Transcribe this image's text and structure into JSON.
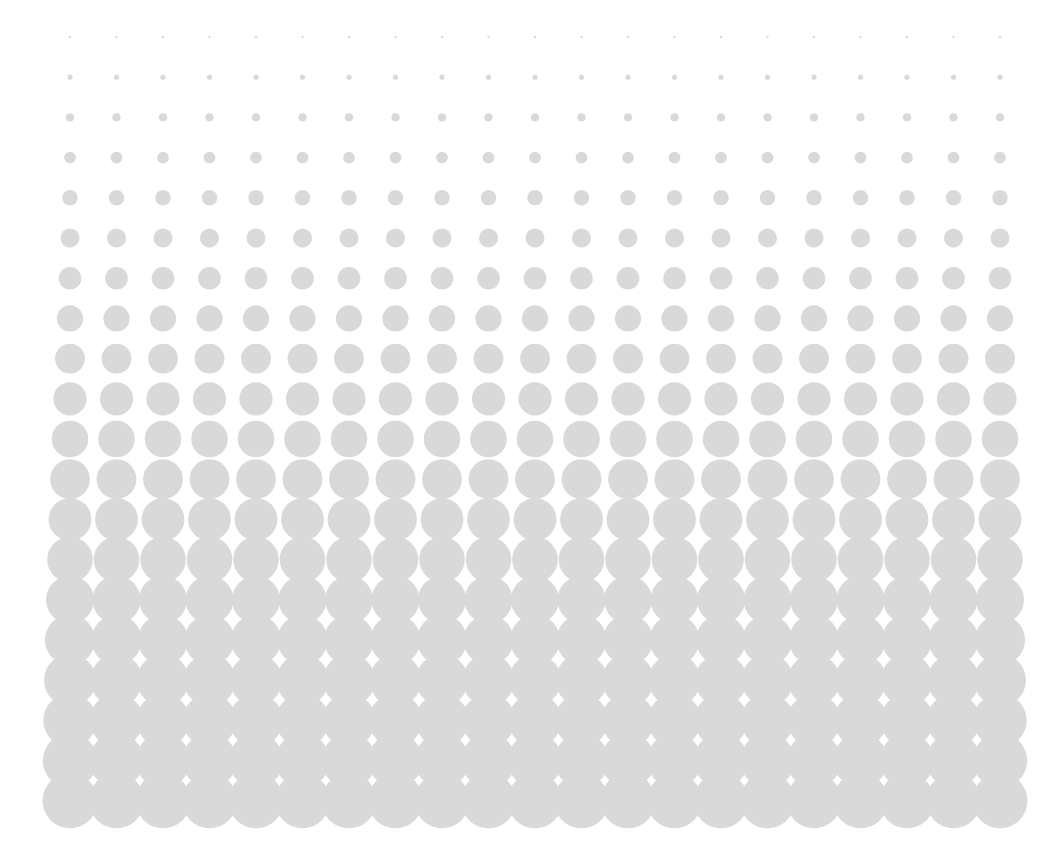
{
  "canvas": {
    "name": "halftone-gradient-pattern",
    "width": 1063,
    "height": 864,
    "background_color": "#ffffff",
    "title": "Halftone Dot Gradient"
  },
  "chart_data": {
    "type": "scatter",
    "subtitle": "",
    "xlabel": "",
    "ylabel": "",
    "grid": false,
    "legend_position": "none",
    "xlim": [
      0,
      1063
    ],
    "ylim": [
      0,
      864
    ],
    "marker_color": "#d9d9d9",
    "background_color": "#ffffff",
    "grid_layout": {
      "columns": 21,
      "rows": 20,
      "x_start": 70,
      "x_step": 46.5,
      "y_start": 37,
      "y_step": 40.2
    },
    "row_radii": [
      1.2,
      2.6,
      4.2,
      5.9,
      7.7,
      9.5,
      11.3,
      13.1,
      14.9,
      16.6,
      18.3,
      19.9,
      21.4,
      22.8,
      24.0,
      25.1,
      26.0,
      26.7,
      27.2,
      27.5
    ],
    "row_centers_y": [
      37.0,
      77.2,
      117.4,
      157.6,
      197.8,
      238.0,
      278.2,
      318.4,
      358.6,
      398.8,
      439.0,
      479.2,
      519.4,
      559.6,
      599.8,
      640.0,
      680.2,
      720.4,
      760.6,
      800.8
    ],
    "column_centers_x": [
      70.0,
      116.5,
      163.0,
      209.5,
      256.0,
      302.5,
      349.0,
      395.5,
      442.0,
      488.5,
      535.0,
      581.5,
      628.0,
      674.5,
      721.0,
      767.5,
      814.0,
      860.5,
      907.0,
      953.5,
      1000.0
    ]
  }
}
